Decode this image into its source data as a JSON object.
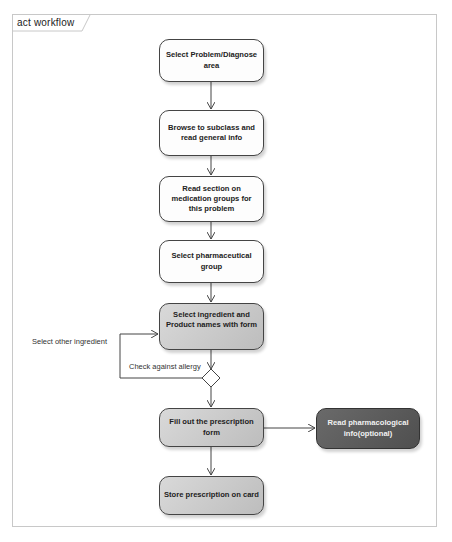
{
  "diagram": {
    "frame_title": "act workflow",
    "type": "UML activity diagram",
    "nodes": [
      {
        "id": "n1",
        "label": "Select Problem/Diagnose area",
        "style": "white"
      },
      {
        "id": "n2",
        "label": "Browse to subclass and read general info",
        "style": "white"
      },
      {
        "id": "n3",
        "label": "Read section on medication groups for this problem",
        "style": "white"
      },
      {
        "id": "n4",
        "label": "Select pharmaceutical group",
        "style": "white"
      },
      {
        "id": "n5",
        "label": "Select ingredient and Product names with form",
        "style": "gray"
      },
      {
        "id": "n6",
        "label": "Fill out the prescription form",
        "style": "gray"
      },
      {
        "id": "n7",
        "label": "Store prescription on card",
        "style": "gray"
      },
      {
        "id": "n8",
        "label": "Read pharmacological info(optional)",
        "style": "dark"
      }
    ],
    "decision": {
      "id": "d1",
      "shape": "diamond"
    },
    "edges": [
      {
        "from": "n1",
        "to": "n2",
        "label": ""
      },
      {
        "from": "n2",
        "to": "n3",
        "label": ""
      },
      {
        "from": "n3",
        "to": "n4",
        "label": ""
      },
      {
        "from": "n4",
        "to": "n5",
        "label": ""
      },
      {
        "from": "n5",
        "to": "d1",
        "label": "Check against allergy"
      },
      {
        "from": "d1",
        "to": "n5",
        "label": "Select other ingredient"
      },
      {
        "from": "d1",
        "to": "n6",
        "label": ""
      },
      {
        "from": "n6",
        "to": "n8",
        "label": ""
      },
      {
        "from": "n6",
        "to": "n7",
        "label": ""
      }
    ],
    "edge_labels": {
      "check_allergy": "Check against allergy",
      "select_other": "Select other ingredient"
    },
    "colors": {
      "frame_border": "#c8c8c8",
      "node_white": "#fdfdfd",
      "node_gray": "#c8c8c8",
      "node_dark": "#5a5a5a",
      "edge": "#444444"
    }
  }
}
